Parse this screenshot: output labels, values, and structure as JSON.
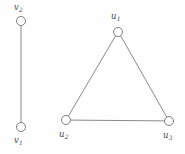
{
  "figure": {
    "name": "graph-diagram",
    "width": 185,
    "height": 154,
    "background_color": "#fefefe",
    "edge_color": "#8a8a8a",
    "vertex_stroke_color": "#7d7d7d",
    "vertex_fill_color": "#ffffff",
    "label_color": "#4a4a4a"
  },
  "components": {
    "edge_component": {
      "name": "K2-component",
      "vertices": [
        {
          "id": "v2",
          "base": "v",
          "subscript": "2",
          "cx": 21,
          "cy": 21,
          "r": 4.5,
          "label_x": 14,
          "label_y": 3
        },
        {
          "id": "v1",
          "base": "v",
          "subscript": "1",
          "cx": 21,
          "cy": 127,
          "r": 4.5,
          "label_x": 14,
          "label_y": 136
        }
      ],
      "edges": [
        {
          "from": "v2",
          "to": "v1",
          "x1": 21,
          "y1": 25.5,
          "x2": 21,
          "y2": 122.5
        }
      ]
    },
    "triangle_component": {
      "name": "K3-component",
      "vertices": [
        {
          "id": "u1",
          "base": "u",
          "subscript": "1",
          "cx": 118,
          "cy": 32,
          "r": 4.5,
          "label_x": 111,
          "label_y": 12
        },
        {
          "id": "u2",
          "base": "u",
          "subscript": "2",
          "cx": 66,
          "cy": 120,
          "r": 4.5,
          "label_x": 59,
          "label_y": 130
        },
        {
          "id": "u3",
          "base": "u",
          "subscript": "3",
          "cx": 169,
          "cy": 121,
          "r": 4.5,
          "label_x": 163,
          "label_y": 131
        }
      ],
      "edges": [
        {
          "from": "u1",
          "to": "u2",
          "x1": 115.6,
          "y1": 35.8,
          "x2": 68.3,
          "y2": 116.2
        },
        {
          "from": "u1",
          "to": "u3",
          "x1": 120.6,
          "y1": 35.7,
          "x2": 166.8,
          "y2": 117.1
        },
        {
          "from": "u2",
          "to": "u3",
          "x1": 70.5,
          "y1": 120.1,
          "x2": 164.5,
          "y2": 120.9
        }
      ]
    }
  },
  "labels": {
    "v2": "v",
    "v2_sub": "2",
    "v1": "v",
    "v1_sub": "1",
    "u1": "u",
    "u1_sub": "1",
    "u2": "u",
    "u2_sub": "2",
    "u3": "u",
    "u3_sub": "3"
  }
}
